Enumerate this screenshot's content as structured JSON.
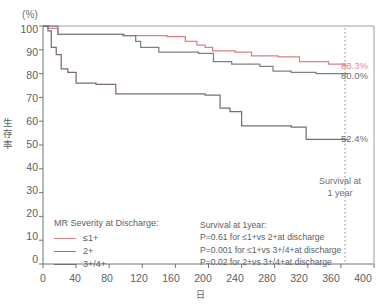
{
  "chart_data": {
    "type": "line",
    "title": "",
    "xlabel": "日",
    "ylabel": "生存率",
    "yunit": "(%)",
    "xlim": [
      0,
      400
    ],
    "ylim": [
      0,
      100
    ],
    "xticks": [
      "0",
      "40",
      "80",
      "120",
      "160",
      "200",
      "240",
      "280",
      "320",
      "360",
      "400"
    ],
    "yticks": [
      "0",
      "10",
      "20",
      "30",
      "40",
      "50",
      "60",
      "70",
      "80",
      "90",
      "100"
    ],
    "grid": false,
    "legend_position": "bottom-left",
    "legend_title": "MR Severity at Discharge:",
    "series": [
      {
        "name": "≤1+",
        "color": "#e07d87",
        "end_label": "83.3%",
        "points": [
          [
            0,
            100
          ],
          [
            6,
            99
          ],
          [
            14,
            99
          ],
          [
            18,
            96.5
          ],
          [
            40,
            96.5
          ],
          [
            96,
            96
          ],
          [
            150,
            95.5
          ],
          [
            172,
            93.5
          ],
          [
            186,
            92
          ],
          [
            196,
            91
          ],
          [
            205,
            89.5
          ],
          [
            232,
            89
          ],
          [
            252,
            87.5
          ],
          [
            284,
            87
          ],
          [
            310,
            85
          ],
          [
            345,
            84
          ],
          [
            365,
            83.3
          ]
        ]
      },
      {
        "name": "2+",
        "color": "#7b8287",
        "end_label": "80.0%",
        "points": [
          [
            0,
            100
          ],
          [
            8,
            100
          ],
          [
            18,
            96.5
          ],
          [
            98,
            96
          ],
          [
            112,
            93.5
          ],
          [
            118,
            91
          ],
          [
            140,
            89
          ],
          [
            188,
            88.5
          ],
          [
            206,
            85
          ],
          [
            228,
            84
          ],
          [
            262,
            83
          ],
          [
            278,
            81
          ],
          [
            300,
            80.5
          ],
          [
            330,
            80
          ],
          [
            365,
            80.0
          ]
        ]
      },
      {
        "name": "3+/4+",
        "color": "#7d6b72",
        "end_label": "52.4%",
        "points": [
          [
            0,
            100
          ],
          [
            6,
            98
          ],
          [
            10,
            91
          ],
          [
            16,
            88
          ],
          [
            22,
            82
          ],
          [
            30,
            80.5
          ],
          [
            40,
            76
          ],
          [
            64,
            75.5
          ],
          [
            88,
            71.5
          ],
          [
            196,
            71
          ],
          [
            214,
            65.5
          ],
          [
            226,
            64
          ],
          [
            240,
            58
          ],
          [
            300,
            57.5
          ],
          [
            318,
            52.4
          ],
          [
            365,
            52.4
          ]
        ]
      }
    ],
    "annotations": {
      "marker_x": 365,
      "marker_line_1": "Survival at",
      "marker_line_2": "1 year",
      "stats_title": "Survival at 1year:",
      "stats_lines": [
        "P=0.61 for ≤1+vs 2+at discharge",
        "P=0.001 for ≤1+vs 3+/4+at discharge",
        "P=0.02 for 2+vs 3+/4+at discharge"
      ]
    }
  }
}
